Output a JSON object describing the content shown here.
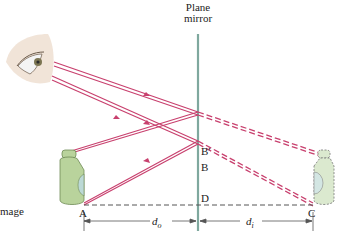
{
  "diagram": {
    "type": "plane-mirror-image-formation",
    "mirror_label_line1": "Plane",
    "mirror_label_line2": "mirror",
    "points": {
      "A": "A",
      "B": "B",
      "B_prime": "B′",
      "C": "C",
      "D": "D"
    },
    "distances": {
      "object": {
        "symbol": "d",
        "subscript": "o"
      },
      "image": {
        "symbol": "d",
        "subscript": "i"
      }
    },
    "side_label": "mage",
    "colors": {
      "ray": "#c8406e",
      "mirror": "#7fa89e",
      "bottle_fill": "#b9d39c",
      "bottle_window": "#bcd9d6",
      "image_bottle_fill": "#dbe9cf",
      "dashed_axis": "#555555"
    }
  }
}
